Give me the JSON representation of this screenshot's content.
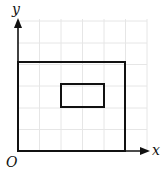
{
  "diagram": {
    "type": "coordinate-grid",
    "axis_labels": {
      "x": "x",
      "y": "y",
      "origin": "O"
    },
    "grid": {
      "columns": 6,
      "rows": 6,
      "cell_px": 21.5,
      "color": "#e6e6e6"
    },
    "shapes": [
      {
        "name": "outer-rectangle",
        "x0": 0,
        "y0": 0,
        "x1": 5,
        "y1": 4,
        "stroke": "#111111"
      },
      {
        "name": "inner-rectangle",
        "x0": 2,
        "y0": 2,
        "x1": 4,
        "y1": 3,
        "stroke": "#111111"
      }
    ]
  }
}
